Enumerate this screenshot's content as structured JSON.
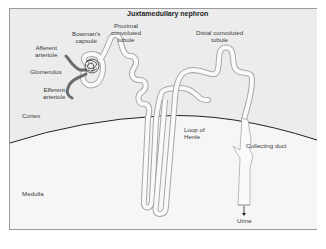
{
  "diagram": {
    "title": "Juxtamedullary nephron",
    "regions": {
      "cortex": "Cortex",
      "medulla": "Medulla"
    },
    "labels": {
      "bowmans_capsule_1": "Bowman's",
      "bowmans_capsule_2": "capsule",
      "proximal_1": "Proximal",
      "proximal_2": "convoluted",
      "proximal_3": "tubule",
      "afferent_1": "Afferent",
      "afferent_2": "arteriole",
      "glomerulus": "Glomerulus",
      "efferent_1": "Efferent",
      "efferent_2": "arteriole",
      "distal_1": "Distal convoluted",
      "distal_2": "tubule",
      "loop_1": "Loop of",
      "loop_2": "Henle",
      "collecting_duct": "Collecting duct",
      "urine": "Urine"
    },
    "colors": {
      "cortex_bg": "#ececec",
      "medulla_bg": "#f6f6f6",
      "tubule_outline": "#a8a8a8",
      "tubule_fill": "#fafafa",
      "arteriole": "#6b6b6b",
      "boundary": "#222222"
    }
  }
}
